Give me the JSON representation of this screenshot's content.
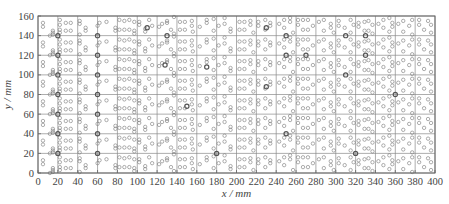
{
  "chart_data": {
    "type": "scatter",
    "title": "",
    "xlabel": "x / mm",
    "ylabel": "y / mm",
    "xlim": [
      0,
      400
    ],
    "ylim": [
      0,
      160
    ],
    "xticks": [
      0,
      20,
      40,
      60,
      80,
      100,
      120,
      140,
      160,
      180,
      200,
      220,
      240,
      260,
      280,
      300,
      320,
      340,
      360,
      380,
      400
    ],
    "yticks": [
      0,
      20,
      40,
      60,
      80,
      100,
      120,
      140,
      160
    ],
    "grid": true,
    "legend": null,
    "marker": "open-circle",
    "row_pitch_mm": 20,
    "rows": 8,
    "cell_patterns_mm": [
      {
        "x0": 0,
        "pts": [
          [
            5,
            13
          ],
          [
            5,
            9
          ],
          [
            15,
            5
          ],
          [
            15,
            1
          ],
          [
            15,
            3
          ],
          [
            12,
            0
          ]
        ]
      },
      {
        "x0": 20,
        "pts": [
          [
            2,
            6
          ],
          [
            2,
            16
          ],
          [
            2,
            11
          ],
          [
            8,
            13
          ],
          [
            13,
            13
          ],
          [
            8,
            5
          ],
          [
            13,
            5
          ],
          [
            2,
            3
          ]
        ]
      },
      {
        "x0": 40,
        "pts": [
          [
            2,
            15
          ],
          [
            2,
            12
          ],
          [
            8,
            8
          ],
          [
            8,
            5
          ],
          [
            2,
            1
          ]
        ]
      },
      {
        "x0": 60,
        "pts": [
          [
            2,
            13
          ],
          [
            0,
            10
          ],
          [
            9,
            14
          ],
          [
            18,
            5
          ],
          [
            18,
            8
          ]
        ]
      },
      {
        "x0": 80,
        "pts": [
          [
            2,
            6
          ],
          [
            2,
            16
          ],
          [
            7,
            15
          ],
          [
            12,
            16
          ],
          [
            7,
            6
          ],
          [
            12,
            6
          ],
          [
            17,
            5
          ],
          [
            17,
            14
          ],
          [
            17,
            2
          ]
        ]
      },
      {
        "x0": 100,
        "pts": [
          [
            2,
            14
          ],
          [
            2,
            11
          ],
          [
            8,
            7
          ],
          [
            8,
            4
          ],
          [
            12,
            16
          ],
          [
            15,
            10
          ]
        ]
      },
      {
        "x0": 120,
        "pts": [
          [
            2,
            9
          ],
          [
            5,
            12
          ],
          [
            10,
            13
          ],
          [
            10,
            15
          ],
          [
            14,
            6
          ],
          [
            17,
            2
          ],
          [
            17,
            19
          ]
        ]
      },
      {
        "x0": 140,
        "pts": [
          [
            3,
            14
          ],
          [
            8,
            14
          ],
          [
            3,
            6
          ],
          [
            8,
            6
          ],
          [
            15,
            15
          ],
          [
            15,
            10
          ],
          [
            16,
            4
          ]
        ]
      },
      {
        "x0": 160,
        "pts": [
          [
            3,
            9
          ],
          [
            10,
            13
          ],
          [
            10,
            16
          ],
          [
            17,
            17
          ],
          [
            17,
            5
          ]
        ]
      },
      {
        "x0": 180,
        "pts": [
          [
            2,
            10
          ],
          [
            8,
            18
          ],
          [
            8,
            12
          ],
          [
            14,
            4
          ],
          [
            14,
            7
          ]
        ]
      },
      {
        "x0": 200,
        "pts": [
          [
            3,
            14
          ],
          [
            8,
            14
          ],
          [
            3,
            6
          ],
          [
            8,
            6
          ],
          [
            14,
            15
          ],
          [
            14,
            11
          ],
          [
            17,
            3
          ]
        ]
      },
      {
        "x0": 220,
        "pts": [
          [
            2,
            14
          ],
          [
            2,
            10
          ],
          [
            9,
            16
          ],
          [
            9,
            6
          ],
          [
            14,
            10
          ],
          [
            14,
            13
          ]
        ]
      },
      {
        "x0": 240,
        "pts": [
          [
            3,
            12
          ],
          [
            8,
            16
          ],
          [
            8,
            8
          ],
          [
            14,
            18
          ],
          [
            14,
            14
          ],
          [
            17,
            3
          ]
        ]
      },
      {
        "x0": 260,
        "pts": [
          [
            2,
            16
          ],
          [
            2,
            11
          ],
          [
            7,
            16
          ],
          [
            12,
            16
          ],
          [
            7,
            6
          ],
          [
            12,
            6
          ],
          [
            17,
            10
          ]
        ]
      },
      {
        "x0": 280,
        "pts": [
          [
            3,
            14
          ],
          [
            8,
            16
          ],
          [
            8,
            5
          ],
          [
            15,
            12
          ],
          [
            15,
            8
          ],
          [
            18,
            3
          ]
        ]
      },
      {
        "x0": 300,
        "pts": [
          [
            3,
            15
          ],
          [
            3,
            10
          ],
          [
            9,
            8
          ],
          [
            15,
            16
          ],
          [
            15,
            3
          ],
          [
            18,
            11
          ]
        ]
      },
      {
        "x0": 320,
        "pts": [
          [
            3,
            13
          ],
          [
            3,
            9
          ],
          [
            9,
            14
          ],
          [
            13,
            15
          ],
          [
            9,
            5
          ],
          [
            13,
            5
          ],
          [
            17,
            11
          ],
          [
            17,
            2
          ]
        ]
      },
      {
        "x0": 340,
        "pts": [
          [
            3,
            12
          ],
          [
            8,
            16
          ],
          [
            8,
            8
          ],
          [
            14,
            18
          ],
          [
            14,
            4
          ],
          [
            17,
            13
          ],
          [
            17,
            9
          ]
        ]
      },
      {
        "x0": 360,
        "pts": [
          [
            3,
            12
          ],
          [
            8,
            15
          ],
          [
            8,
            4
          ],
          [
            14,
            10
          ],
          [
            17,
            16
          ],
          [
            17,
            1
          ]
        ]
      },
      {
        "x0": 380,
        "pts": [
          [
            4,
            16
          ],
          [
            4,
            11
          ],
          [
            9,
            6
          ],
          [
            13,
            15
          ],
          [
            16,
            11
          ],
          [
            16,
            3
          ]
        ]
      }
    ],
    "heavy_points_mm": [
      [
        20,
        140
      ],
      [
        20,
        120
      ],
      [
        20,
        100
      ],
      [
        20,
        80
      ],
      [
        20,
        60
      ],
      [
        20,
        40
      ],
      [
        20,
        20
      ],
      [
        60,
        140
      ],
      [
        60,
        120
      ],
      [
        60,
        100
      ],
      [
        60,
        80
      ],
      [
        60,
        60
      ],
      [
        60,
        40
      ],
      [
        60,
        20
      ],
      [
        110,
        148
      ],
      [
        128,
        110
      ],
      [
        130,
        140
      ],
      [
        150,
        68
      ],
      [
        170,
        108
      ],
      [
        180,
        20
      ],
      [
        230,
        148
      ],
      [
        230,
        88
      ],
      [
        250,
        140
      ],
      [
        250,
        120
      ],
      [
        250,
        40
      ],
      [
        270,
        120
      ],
      [
        310,
        140
      ],
      [
        310,
        100
      ],
      [
        320,
        20
      ],
      [
        330,
        140
      ],
      [
        330,
        120
      ],
      [
        360,
        80
      ]
    ]
  },
  "figure": {
    "colors": {
      "frame": "#666666",
      "grid": "#8a8a8a",
      "marker": "#777777",
      "text": "#444444"
    }
  }
}
